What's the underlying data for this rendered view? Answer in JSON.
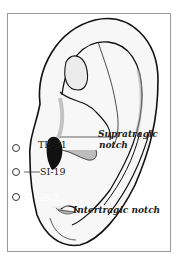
{
  "figure": {
    "colors": {
      "frame": "#9a9a9a",
      "outline": "#111111",
      "shade": "#b5b5b5",
      "dark": "#111111"
    }
  },
  "points": [
    {
      "id": "TE-21",
      "label": "TE-21"
    },
    {
      "id": "SI-19",
      "label": "SI-19"
    },
    {
      "id": "GB-2",
      "label": "GB-2"
    }
  ],
  "annotations": [
    {
      "id": "supratragic",
      "line1": "Supratragic",
      "line2": "notch"
    },
    {
      "id": "intertragic",
      "line1": "Intertragic notch"
    }
  ]
}
